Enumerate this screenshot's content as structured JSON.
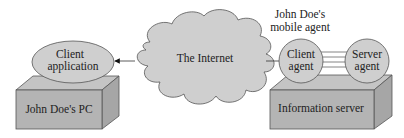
{
  "diagram": {
    "cloud": {
      "label": "The Internet"
    },
    "left": {
      "client_application": {
        "line1": "Client",
        "line2": "application"
      },
      "pc": {
        "label": "John Doe's PC"
      }
    },
    "right": {
      "mobile_agent_caption": {
        "line1": "John Doe's",
        "line2": "mobile agent"
      },
      "client_agent": {
        "line1": "Client",
        "line2": "agent"
      },
      "server_agent": {
        "line1": "Server",
        "line2": "agent"
      },
      "server": {
        "label": "Information server"
      }
    },
    "colors": {
      "fill": "#cfcfcf",
      "box_front": "#b4b4b4",
      "box_top": "#c4c4c4",
      "box_side": "#a6a6a6",
      "stroke": "#555555"
    }
  }
}
